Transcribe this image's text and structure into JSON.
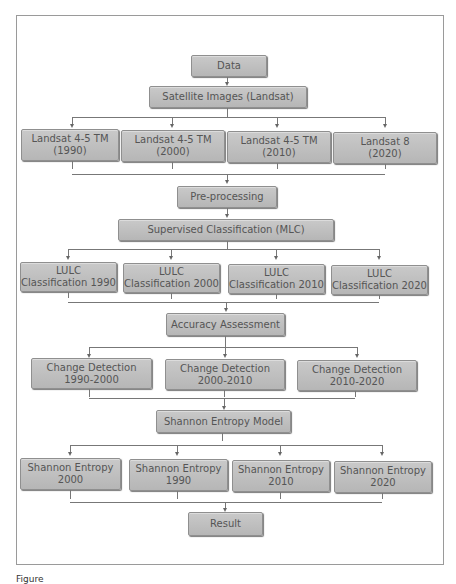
{
  "diagram": {
    "type": "flowchart",
    "nodes": {
      "data": "Data",
      "satellite": "Satellite Images (Landsat)",
      "landsat": [
        "Landsat 4-5 TM\n(1990)",
        "Landsat 4-5 TM\n(2000)",
        "Landsat 4-5 TM\n(2010)",
        "Landsat 8\n(2020)"
      ],
      "preprocessing": "Pre-processing",
      "supervised": "Supervised Classification (MLC)",
      "lulc": [
        "LULC\nClassification 1990",
        "LULC\nClassification 2000",
        "LULC\nClassification 2010",
        "LULC\nClassification 2020"
      ],
      "accuracy": "Accuracy Assessment",
      "change": [
        "Change Detection\n1990-2000",
        "Change Detection\n2000-2010",
        "Change Detection\n2010-2020"
      ],
      "shannon_model": "Shannon Entropy Model",
      "shannon": [
        "Shannon Entropy\n2000",
        "Shannon Entropy\n1990",
        "Shannon Entropy\n2010",
        "Shannon Entropy\n2020"
      ],
      "result": "Result"
    },
    "colors": {
      "box_fill": "#c0c0c0",
      "box_border": "#8f8f8f",
      "text": "#555555",
      "connector": "#777777",
      "frame": "#9a9a9a"
    }
  },
  "caption": "Figure"
}
